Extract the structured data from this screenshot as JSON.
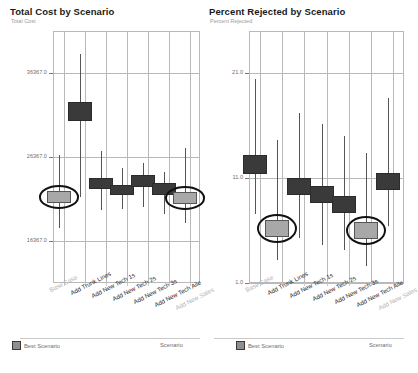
{
  "legend": {
    "best_scenario_label": "Best Scenario",
    "scenario_axis_label": "Scenario",
    "swatch_color": "#8f8f8f"
  },
  "colors": {
    "bar": "#3a3a3a",
    "best_bar": "#a8a8a8",
    "whisker": "#555555",
    "grid": "#b9b9b9",
    "highlight_ring": "#111111"
  },
  "footer": {
    "text": ""
  },
  "chart_data": [
    {
      "type": "bar",
      "id": "total-cost",
      "title": "Total Cost by Scenario",
      "subtitle": "Total Cost",
      "ylabel": "Total Cost",
      "xlabel": "Scenario",
      "ylim": [
        11367.0,
        41367.0
      ],
      "yticks": [
        36367.0,
        26367.0,
        16367.0
      ],
      "ytick_labels": [
        "36367.0",
        "26367.0",
        "16367.0"
      ],
      "grid": true,
      "legend_position": "bottom-left",
      "categories": [
        "Base Case",
        "Add Trunk Lines",
        "Add New Tech 1s",
        "Add New Tech 2s",
        "Add New Tech 3s",
        "Add New Tech Aile",
        "Add New Sales"
      ],
      "values": [
        21600,
        31800,
        23200,
        22400,
        23500,
        22600,
        21500
      ],
      "box_low": [
        20900,
        30700,
        22500,
        21800,
        22800,
        21900,
        20800
      ],
      "box_high": [
        22300,
        32900,
        23900,
        23000,
        24200,
        23300,
        22200
      ],
      "whisker_low": [
        17900,
        21600,
        20100,
        20200,
        20400,
        19600,
        18500
      ],
      "whisker_high": [
        26600,
        38600,
        27100,
        25100,
        25700,
        24600,
        27400
      ],
      "best_scenario_index": [
        0,
        6
      ],
      "highlighted_index": [
        0,
        6
      ]
    },
    {
      "type": "bar",
      "id": "percent-rejected",
      "title": "Percent Rejected by Scenario",
      "subtitle": "Percent Rejected",
      "ylabel": "Percent Rejected",
      "xlabel": "Scenario",
      "ylim": [
        1.0,
        25.0
      ],
      "yticks": [
        21.0,
        11.0,
        1.0
      ],
      "ytick_labels": [
        "21.0",
        "11.0",
        "1.0"
      ],
      "grid": true,
      "legend_position": "bottom-left",
      "categories": [
        "Base Case",
        "Add Trunk Lines",
        "Add New Tech 1s",
        "Add New Tech 2s",
        "Add New Tech 3s",
        "Add New Tech Aile",
        "Add New Sales"
      ],
      "values": [
        12.3,
        6.2,
        10.2,
        9.4,
        8.5,
        6.0,
        10.7
      ],
      "box_low": [
        11.4,
        5.4,
        9.4,
        8.6,
        7.7,
        5.2,
        9.9
      ],
      "box_high": [
        13.2,
        7.0,
        11.0,
        10.2,
        9.3,
        6.8,
        11.5
      ],
      "whisker_low": [
        7.6,
        3.2,
        5.3,
        4.6,
        4.1,
        2.6,
        6.4
      ],
      "whisker_high": [
        20.4,
        14.6,
        17.2,
        16.1,
        15.0,
        13.4,
        18.6
      ],
      "best_scenario_index": [
        1,
        5
      ],
      "highlighted_index": [
        1,
        5
      ]
    }
  ]
}
